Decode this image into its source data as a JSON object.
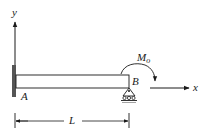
{
  "figure": {
    "type": "cantilever beam with roller support and applied moment",
    "labels": {
      "y_axis": "y",
      "x_axis": "x",
      "point_a": "A",
      "point_b": "B",
      "moment_main": "M",
      "moment_sub": "o",
      "length": "L"
    },
    "colors": {
      "line": "#1a1a1a",
      "wall": "#555555",
      "beam_fill": "#ffffff",
      "ground": "#333333"
    }
  }
}
